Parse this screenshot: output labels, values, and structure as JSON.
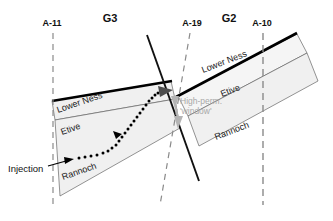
{
  "figure": {
    "type": "geological-cross-section",
    "background_color": "#ffffff"
  },
  "blocks": [
    {
      "id": "G3",
      "label": "G3",
      "label_x": 110,
      "label_y": 22
    },
    {
      "id": "G2",
      "label": "G2",
      "label_x": 229,
      "label_y": 22
    }
  ],
  "wells": [
    {
      "id": "A-11",
      "label": "A-11",
      "label_x": 52,
      "label_y": 26,
      "style": "vertical-dashed"
    },
    {
      "id": "A-19",
      "label": "A-19",
      "label_x": 192,
      "label_y": 26,
      "style": "slanted-dashed"
    },
    {
      "id": "A-10",
      "label": "A-10",
      "label_x": 262,
      "label_y": 26,
      "style": "vertical-dashed"
    }
  ],
  "units": {
    "left_block": [
      {
        "name": "Lower Ness",
        "x": 58,
        "y": 113,
        "rotation": -19
      },
      {
        "name": "Etive",
        "x": 62,
        "y": 135,
        "rotation": -19
      },
      {
        "name": "Rannoch",
        "x": 63,
        "y": 180,
        "rotation": -19
      }
    ],
    "right_block": [
      {
        "name": "Lower Ness",
        "x": 203,
        "y": 73,
        "rotation": -21
      },
      {
        "name": "Etive",
        "x": 222,
        "y": 97,
        "rotation": -21
      },
      {
        "name": "Rannoch",
        "x": 216,
        "y": 140,
        "rotation": -21
      }
    ]
  },
  "annotations": {
    "injection": {
      "text": "Injection",
      "x": 8,
      "y": 172
    },
    "high_perm": {
      "line1": "High-perm.",
      "line2": "'window'",
      "x": 180,
      "y": 104,
      "color": "#a8a8a8"
    }
  },
  "colors": {
    "layer_fill": "#f0f0f0",
    "layer_fill_light": "#f7f7f7",
    "outline": "#555555",
    "top_surface": "#000000",
    "fault": "#111111",
    "well_dash": "#888888",
    "flow_path": "#000000",
    "cross_fault_arrow": "#9a9a9a"
  },
  "flow": {
    "description": "dotted injection pathway from Rannoch up through Etive to the fault",
    "dot_count": 30,
    "arrow_count": 2
  }
}
